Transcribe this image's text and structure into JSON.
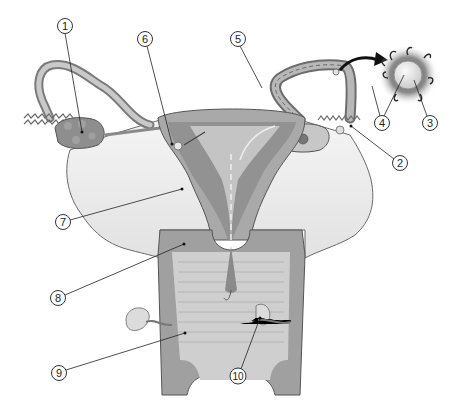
{
  "diagram": {
    "colors": {
      "background": "#ffffff",
      "tissue_dark": "#8a8a8a",
      "tissue_mid": "#a9a9a9",
      "tissue_light": "#c8c8c8",
      "ligament": "#ececec",
      "outline": "#555555",
      "leader_line": "#222222",
      "egg_halo": "#6e6e6e"
    },
    "callouts": [
      {
        "id": "1",
        "label": "1",
        "x": 65,
        "y": 26,
        "target": [
          82,
          132
        ]
      },
      {
        "id": "2",
        "label": "2",
        "x": 400,
        "y": 163,
        "target": [
          351,
          126
        ]
      },
      {
        "id": "3",
        "label": "3",
        "x": 430,
        "y": 123,
        "target": [
          414,
          80
        ]
      },
      {
        "id": "4",
        "label": "4",
        "x": 382,
        "y": 123,
        "target_a": [
          372,
          86
        ],
        "target_b": [
          404,
          75
        ]
      },
      {
        "id": "5",
        "label": "5",
        "x": 238,
        "y": 39,
        "target": [
          262,
          88
        ]
      },
      {
        "id": "6",
        "label": "6",
        "x": 145,
        "y": 39,
        "target": [
          172,
          144
        ]
      },
      {
        "id": "7",
        "label": "7",
        "x": 63,
        "y": 222,
        "target": [
          182,
          189
        ]
      },
      {
        "id": "8",
        "label": "8",
        "x": 58,
        "y": 298,
        "target": [
          184,
          244
        ]
      },
      {
        "id": "9",
        "label": "9",
        "x": 59,
        "y": 373,
        "target": [
          185,
          333
        ]
      },
      {
        "id": "10",
        "label": "10",
        "x": 238,
        "y": 376,
        "target": [
          260,
          318
        ]
      }
    ]
  }
}
